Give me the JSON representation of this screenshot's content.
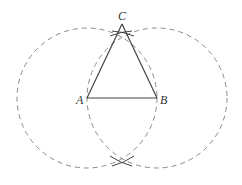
{
  "diagram": {
    "points": {
      "A": {
        "label": "A",
        "x": 87,
        "y": 98
      },
      "B": {
        "label": "B",
        "x": 157,
        "y": 98
      },
      "C": {
        "label": "C",
        "x": 122,
        "y": 24
      }
    },
    "circles": [
      {
        "center": "A",
        "radius": 70,
        "style": "dashed"
      },
      {
        "center": "B",
        "radius": 70,
        "style": "dashed"
      }
    ],
    "colors": {
      "line": "#444444",
      "dashed": "#8a8a8a",
      "label": "#333333"
    }
  }
}
